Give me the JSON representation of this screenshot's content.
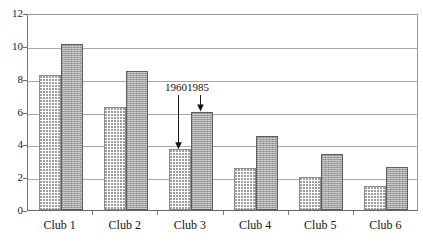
{
  "chart_data": {
    "type": "bar",
    "title": "",
    "subtitle": "",
    "xlabel": "",
    "ylabel": "",
    "categories": [
      "Club 1",
      "Club 2",
      "Club 3",
      "Club 4",
      "Club 5",
      "Club 6"
    ],
    "series": [
      {
        "name": "1960",
        "values": [
          8.2,
          6.3,
          3.7,
          2.55,
          2.0,
          1.45
        ]
      },
      {
        "name": "1985",
        "values": [
          10.1,
          8.5,
          6.0,
          4.5,
          3.4,
          2.6
        ]
      }
    ],
    "ylim": [
      0,
      12
    ],
    "ytick_labels": [
      "0",
      "2",
      "4",
      "6",
      "8",
      "10",
      "12"
    ],
    "ytick_values": [
      0,
      2,
      4,
      6,
      8,
      10,
      12
    ],
    "grid": true,
    "legend": "none",
    "annotations": [
      {
        "text": "1960",
        "points_to_series": "1960",
        "points_to_category": "Club 3",
        "value": 3.7
      },
      {
        "text": "1985",
        "points_to_series": "1985",
        "points_to_category": "Club 3",
        "value": 6.0
      }
    ],
    "colors": {
      "series_1960_fill": "#fdfdfd",
      "series_1960_pattern": "#9b9b9b",
      "series_1985_fill": "#a3a3a3",
      "axis": "#666666",
      "grid": "#a8a8a8",
      "text": "#131313"
    }
  }
}
